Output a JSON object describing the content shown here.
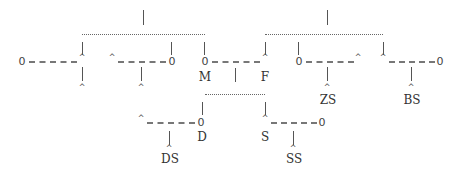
{
  "nodes": {
    "l1_zero": "0",
    "l1_caret": "^",
    "l2_caret": "^",
    "l2_zero": "0",
    "m_zero": "0",
    "f_caret": "^",
    "r1_zero": "0",
    "r1_caret": "^",
    "r2_caret": "^",
    "r2_zero": "0",
    "d_caret": "^",
    "d_zero": "0",
    "s_caret": "^",
    "s_zero": "0",
    "end_l1": "^",
    "end_l2": "^",
    "end_zs": "^",
    "end_bs": "^",
    "end_ds": "^",
    "end_ss": "^"
  },
  "labels": {
    "m": "M",
    "f": "F",
    "zs": "ZS",
    "bs": "BS",
    "d": "D",
    "s": "S",
    "ds": "DS",
    "ss": "SS"
  }
}
